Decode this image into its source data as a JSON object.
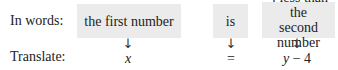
{
  "rows": {
    "words_label": "In words:",
    "translate_label": "Translate:"
  },
  "phrases": [
    {
      "text": "the first number"
    },
    {
      "text": "is"
    },
    {
      "line1": "4 less than the",
      "line2": "second number"
    }
  ],
  "arrow_glyph": "↓",
  "translations": [
    {
      "text": "x"
    },
    {
      "text": "="
    },
    {
      "var": "y",
      "rest": " − 4"
    }
  ],
  "colors": {
    "box_bg": "#ebebeb",
    "text": "#222222"
  }
}
